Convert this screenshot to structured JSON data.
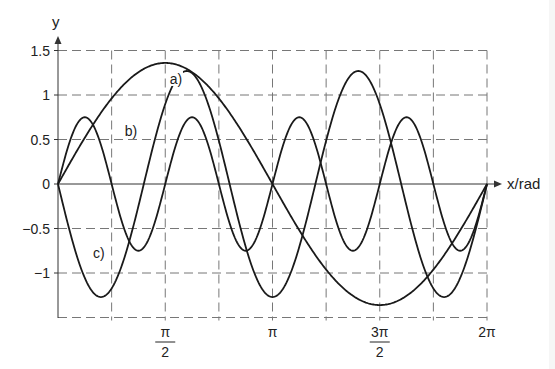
{
  "chart_data": {
    "type": "line",
    "title": "",
    "xlabel": "x/rad",
    "ylabel": "y",
    "xlim": [
      0,
      6.2832
    ],
    "ylim": [
      -1.5,
      1.5
    ],
    "grid": true,
    "x_ticks": [
      {
        "value": 1.5708,
        "label": "π",
        "denominator": "2"
      },
      {
        "value": 3.1416,
        "label": "π",
        "denominator": ""
      },
      {
        "value": 4.7124,
        "label": "3π",
        "denominator": "2"
      },
      {
        "value": 6.2832,
        "label": "2π",
        "denominator": ""
      }
    ],
    "x_gridlines_pi_fraction": [
      0.25,
      0.5,
      0.75,
      1,
      1.25,
      1.5,
      1.75,
      2
    ],
    "y_ticks": [
      {
        "value": 1.5,
        "label": "1.5"
      },
      {
        "value": 1,
        "label": "1"
      },
      {
        "value": 0.5,
        "label": "0.5"
      },
      {
        "value": 0,
        "label": "0"
      },
      {
        "value": -0.5,
        "label": "-0.5"
      },
      {
        "value": -1,
        "label": "-1"
      }
    ],
    "y_gridlines": [
      1.5,
      1,
      0.5,
      -0.5,
      -1,
      -1.5
    ],
    "series": [
      {
        "name": "a)",
        "function": "1.36*sin(x)",
        "amplitude": 1.36,
        "frequency": 1,
        "sign": 1,
        "label_at": [
          0.55,
          1.18
        ]
      },
      {
        "name": "b)",
        "function": "0.75*sin(4x)",
        "amplitude": 0.75,
        "frequency": 4,
        "sign": 1,
        "label_at": [
          0.34,
          0.6
        ]
      },
      {
        "name": "c)",
        "function": "-1.27*sin(2.5x)",
        "amplitude": 1.27,
        "frequency": 2.5,
        "sign": -1,
        "label_at": [
          0.19,
          -0.78
        ]
      }
    ]
  }
}
